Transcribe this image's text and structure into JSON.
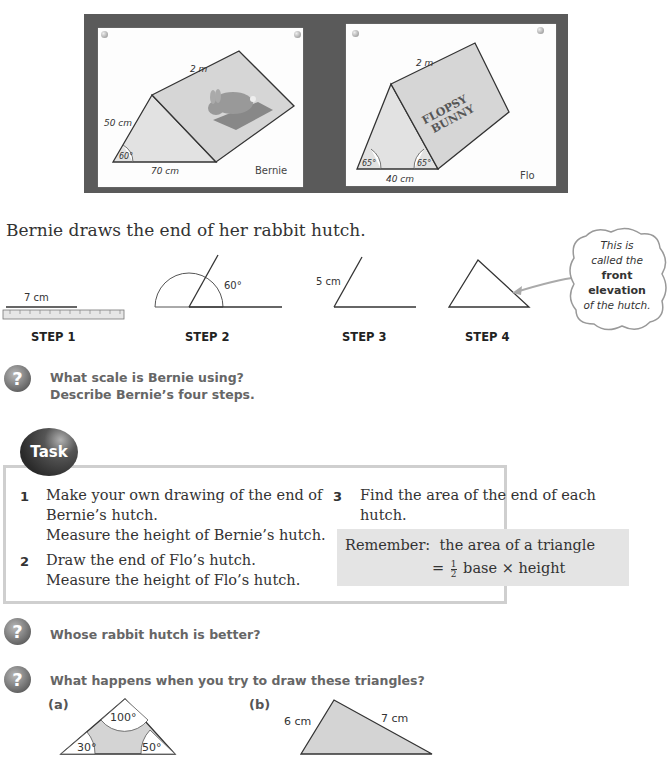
{
  "photos": {
    "bernie": {
      "length_label": "2 m",
      "side_label": "50 cm",
      "base_label": "70 cm",
      "angle_label": "60°",
      "signature": "Bernie"
    },
    "flo": {
      "length_label": "2 m",
      "base_label": "40 cm",
      "angle_left_label": "65°",
      "angle_right_label": "65°",
      "sign_line1": "FLOPSY",
      "sign_line2": "BUNNY",
      "signature": "Flo"
    }
  },
  "intro_text": "Bernie draws the end of her rabbit hutch.",
  "steps": [
    {
      "label": "STEP 1",
      "annotation": "7 cm"
    },
    {
      "label": "STEP 2",
      "annotation": "60°"
    },
    {
      "label": "STEP 3",
      "annotation": "5 cm"
    },
    {
      "label": "STEP 4",
      "annotation": ""
    }
  ],
  "callout": {
    "line1": "This is",
    "line2": "called the",
    "line3_bold": "front",
    "line4_bold": "elevation",
    "line5": "of the hutch."
  },
  "question1": {
    "line1": "What scale is Bernie using?",
    "line2": "Describe Bernie’s four steps."
  },
  "task": {
    "badge": "Task",
    "items": [
      {
        "num": "1",
        "line1": "Make your own drawing of the end of",
        "line2": "Bernie’s hutch.",
        "line3": "Measure the height of Bernie’s hutch."
      },
      {
        "num": "2",
        "line1": "Draw the end of Flo’s hutch.",
        "line2": "Measure the height of Flo’s hutch."
      },
      {
        "num": "3",
        "line1": "Find the area of the end of each",
        "line2": "hutch."
      }
    ],
    "remember": {
      "label": "Remember:",
      "line1": "the area of a triangle",
      "equals": "=",
      "frac_num": "1",
      "frac_den": "2",
      "line2": "base × height"
    }
  },
  "question2": "Whose rabbit hutch is better?",
  "question3": "What happens when you try to draw these triangles?",
  "triangles": {
    "a": {
      "label": "(a)",
      "top_angle": "100°",
      "left_angle": "30°",
      "right_angle": "50°"
    },
    "b": {
      "label": "(b)",
      "left_side": "6 cm",
      "right_side": "7 cm"
    }
  }
}
